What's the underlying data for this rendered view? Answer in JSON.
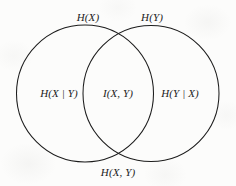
{
  "diagram": {
    "stroke_color": "#1c1c1c",
    "background_color": "#fcfcfb",
    "text_color": "#1b1b1b",
    "circles": [
      {
        "name": "x-circle",
        "cx": 85,
        "cy": 93.5,
        "r": 68.5
      },
      {
        "name": "y-circle",
        "cx": 151,
        "cy": 93.5,
        "r": 68.0
      }
    ],
    "labels": {
      "h_x": "H(X)",
      "h_y": "H(Y)",
      "h_x_given_y": "H(X | Y)",
      "mutual_information": "I(X, Y)",
      "h_y_given_x": "H(Y | X)",
      "joint_entropy": "H(X, Y)"
    },
    "label_positions": {
      "h_x": {
        "x": 88,
        "y": 17
      },
      "h_y": {
        "x": 152,
        "y": 17
      },
      "h_x_given_y": {
        "x": 59,
        "y": 93
      },
      "mutual_information": {
        "x": 118,
        "y": 93
      },
      "h_y_given_x": {
        "x": 180,
        "y": 93
      },
      "joint_entropy": {
        "x": 118,
        "y": 172
      }
    }
  }
}
